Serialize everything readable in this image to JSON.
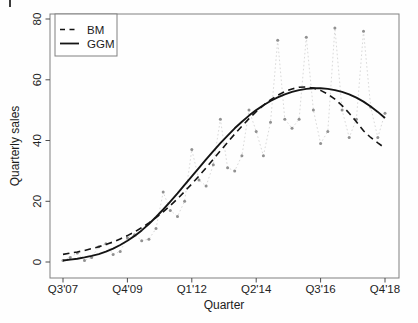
{
  "chart_data": {
    "type": "line",
    "title": "",
    "xlabel": "Quarter",
    "ylabel": "Quarterly sales",
    "xlim": [
      0,
      45
    ],
    "ylim": [
      0,
      80
    ],
    "grid": false,
    "x_tick_positions": [
      0,
      9,
      18,
      27,
      36,
      45
    ],
    "x_tick_labels": [
      "Q3'07",
      "Q4'09",
      "Q1'12",
      "Q2'14",
      "Q3'16",
      "Q4'18"
    ],
    "y_ticks": [
      0,
      20,
      40,
      60,
      80
    ],
    "legend": {
      "position": "topleft",
      "entries": [
        {
          "label": "BM",
          "style": "dashed"
        },
        {
          "label": "GGM",
          "style": "solid"
        }
      ]
    },
    "colors": {
      "model_lines": "#141414",
      "observed_points": "#919191",
      "observed_connector": "#d9d9d9",
      "plot_border": "#808080",
      "tick": "#4d4d4d"
    },
    "series": [
      {
        "name": "Observed quarterly sales",
        "style": "points-dotted",
        "values": [
          0.5,
          1.5,
          3,
          0.5,
          1.5,
          5,
          6,
          2.5,
          3.5,
          8,
          9,
          7,
          7.5,
          11,
          23,
          17,
          15,
          20,
          37,
          27,
          25,
          32,
          47,
          31,
          30,
          35,
          50,
          43,
          35,
          46,
          73,
          47,
          44,
          47,
          74,
          50,
          39,
          43,
          77,
          50,
          41,
          47,
          76,
          51,
          41,
          49
        ]
      },
      {
        "name": "BM",
        "style": "dashed",
        "values": [
          2.5,
          2.9,
          3.3,
          3.8,
          4.4,
          5.0,
          5.8,
          6.6,
          7.6,
          8.7,
          9.9,
          11.3,
          12.9,
          14.6,
          16.5,
          18.6,
          20.8,
          23.2,
          25.7,
          28.3,
          31.0,
          33.8,
          36.6,
          39.4,
          42.1,
          44.7,
          47.2,
          49.5,
          51.6,
          53.4,
          54.9,
          56.1,
          57.0,
          57.5,
          57.6,
          57.3,
          56.5,
          55.3,
          53.6,
          51.5,
          49.0,
          46.2,
          43.2,
          41.0,
          39.2,
          37.5
        ]
      },
      {
        "name": "GGM",
        "style": "solid",
        "values": [
          0.5,
          0.8,
          1.1,
          1.5,
          2.0,
          2.6,
          3.4,
          4.4,
          5.6,
          7.0,
          8.6,
          10.4,
          12.5,
          14.8,
          17.3,
          19.9,
          22.6,
          25.4,
          28.2,
          31.0,
          33.8,
          36.5,
          39.1,
          41.6,
          44.0,
          46.2,
          48.2,
          50.0,
          51.6,
          53.0,
          54.2,
          55.2,
          56.0,
          56.6,
          57.0,
          57.2,
          57.2,
          57.0,
          56.6,
          56.0,
          55.2,
          54.1,
          52.8,
          51.2,
          49.4,
          47.4
        ]
      }
    ]
  }
}
